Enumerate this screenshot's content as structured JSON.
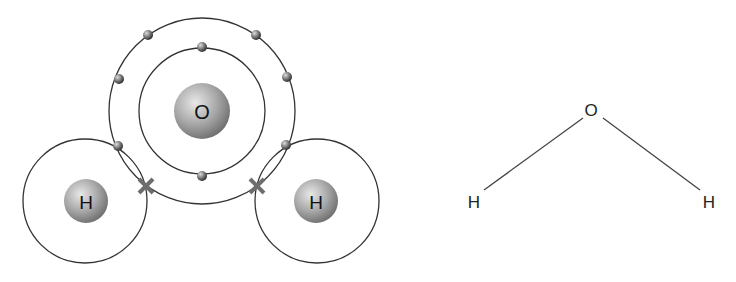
{
  "colors": {
    "shell": "#333333",
    "bond_cross": "#6e6e6e",
    "nucleus_light": "#e4e4e4",
    "nucleus_dark": "#7a7a7a",
    "electron_light": "#d8d8d8",
    "electron_dark": "#3c3c3c"
  },
  "bohr_model": {
    "oxygen": {
      "label": "O",
      "nucleus": {
        "cx": 202,
        "cy": 111,
        "r": 28
      },
      "shells": [
        {
          "name": "inner",
          "r": 63
        },
        {
          "name": "outer",
          "r": 93
        }
      ],
      "inner_electrons": [
        [
          202,
          47
        ],
        [
          202,
          176
        ]
      ],
      "outer_electrons": [
        [
          148,
          35
        ],
        [
          256,
          35
        ],
        [
          119,
          79
        ],
        [
          287,
          77
        ],
        [
          118,
          146
        ],
        [
          286,
          145
        ]
      ]
    },
    "hydrogen_left": {
      "label": "H",
      "nucleus": {
        "cx": 86,
        "cy": 201,
        "r": 22
      },
      "shell": {
        "cx": 85,
        "cy": 201,
        "r": 62
      }
    },
    "hydrogen_right": {
      "label": "H",
      "nucleus": {
        "cx": 316,
        "cy": 201,
        "r": 22
      },
      "shell": {
        "cx": 317,
        "cy": 201,
        "r": 62
      }
    },
    "shared_electron_markers": [
      {
        "symbol": "×",
        "x": 146,
        "y": 186
      },
      {
        "symbol": "×",
        "x": 257,
        "y": 186
      }
    ]
  },
  "structural_formula": {
    "oxygen_label": "O",
    "hydrogen_left_label": "H",
    "hydrogen_right_label": "H"
  }
}
